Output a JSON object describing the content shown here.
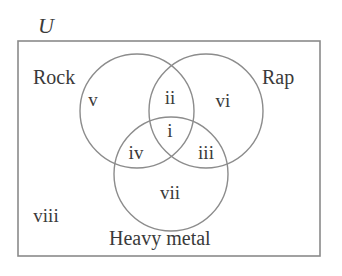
{
  "diagram": {
    "type": "venn-3",
    "universe": {
      "label": "U"
    },
    "sets": [
      {
        "id": "rock",
        "label": "Rock"
      },
      {
        "id": "rap",
        "label": "Rap"
      },
      {
        "id": "heavy_metal",
        "label": "Heavy metal"
      }
    ],
    "regions": [
      {
        "id": "i",
        "label": "i",
        "membership": [
          "Rock",
          "Rap",
          "Heavy metal"
        ]
      },
      {
        "id": "ii",
        "label": "ii",
        "membership": [
          "Rock",
          "Rap"
        ]
      },
      {
        "id": "iii",
        "label": "iii",
        "membership": [
          "Rap",
          "Heavy metal"
        ]
      },
      {
        "id": "iv",
        "label": "iv",
        "membership": [
          "Rock",
          "Heavy metal"
        ]
      },
      {
        "id": "v",
        "label": "v",
        "membership": [
          "Rock"
        ]
      },
      {
        "id": "vi",
        "label": "vi",
        "membership": [
          "Rap"
        ]
      },
      {
        "id": "vii",
        "label": "vii",
        "membership": [
          "Heavy metal"
        ]
      },
      {
        "id": "viii",
        "label": "viii",
        "membership": []
      }
    ],
    "colors": {
      "stroke": "#8c8c8c",
      "text": "#3a3a3a",
      "background": "#ffffff"
    }
  }
}
